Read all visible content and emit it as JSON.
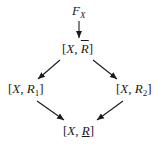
{
  "diagram": {
    "type": "lattice-diagram",
    "nodes": [
      {
        "id": "top",
        "label": "F_X",
        "main": "F",
        "sub": "X"
      },
      {
        "id": "upper",
        "label": "[X, R̄]",
        "prefix": "[",
        "var": "X",
        "sep": ", ",
        "rel": "R",
        "rel_decoration": "overline",
        "suffix": "]"
      },
      {
        "id": "left",
        "label": "[X, R1]",
        "prefix": "[",
        "var": "X",
        "sep": ", ",
        "rel": "R",
        "rel_sub": "1",
        "suffix": "]"
      },
      {
        "id": "right",
        "label": "[X, R2]",
        "prefix": "[",
        "var": "X",
        "sep": ", ",
        "rel": "R",
        "rel_sub": "2",
        "suffix": "]"
      },
      {
        "id": "bottom",
        "label": "[X, R̲]",
        "prefix": "[",
        "var": "X",
        "sep": ", ",
        "rel": "R",
        "rel_decoration": "underline",
        "suffix": "]"
      }
    ],
    "edges": [
      {
        "from": "top",
        "to": "upper"
      },
      {
        "from": "upper",
        "to": "left"
      },
      {
        "from": "upper",
        "to": "right"
      },
      {
        "from": "left",
        "to": "bottom"
      },
      {
        "from": "right",
        "to": "bottom"
      }
    ],
    "colors": {
      "ink": "#1a1a1a",
      "background": "#ffffff"
    }
  }
}
